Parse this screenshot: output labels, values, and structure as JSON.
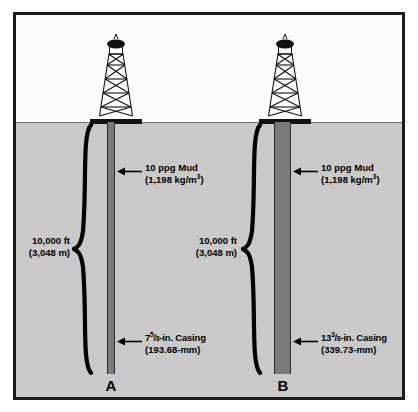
{
  "figure": {
    "colors": {
      "sky": "#fcfcfc",
      "ground": "#c9c9c9",
      "casing": "#7a7a7a",
      "border": "#1b1b1b",
      "ink": "#000000"
    }
  },
  "wells": [
    {
      "id": "A",
      "letter": "A",
      "depth": {
        "imperial": "10,000 ft",
        "metric": "(3,048 m)"
      },
      "mud": {
        "line1": "10 ppg Mud",
        "line2_prefix": "(1,198 kg/m",
        "line2_exp": "3",
        "line2_suffix": ")"
      },
      "casing": {
        "whole": "7",
        "num": "5",
        "den": "8",
        "unit_label": "-in. Casing",
        "metric": "(193.68-mm)"
      }
    },
    {
      "id": "B",
      "letter": "B",
      "depth": {
        "imperial": "10,000 ft",
        "metric": "(3,048 m)"
      },
      "mud": {
        "line1": "10 ppg Mud",
        "line2_prefix": "(1,198 kg/m",
        "line2_exp": "3",
        "line2_suffix": ")"
      },
      "casing": {
        "whole": "13",
        "num": "3",
        "den": "8",
        "unit_label": "-in. Casing",
        "metric": "(339.73-mm)"
      }
    }
  ]
}
